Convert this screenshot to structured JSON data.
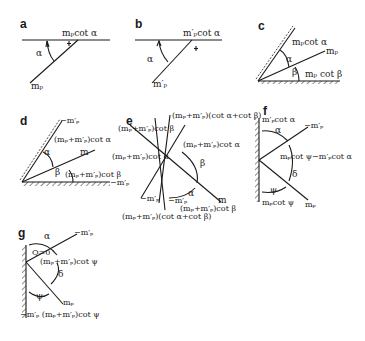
{
  "figure": {
    "panels": [
      {
        "id": "a",
        "label": "a",
        "texts": {
          "top": "mₚcot α",
          "alpha": "α",
          "m": "mₚ"
        }
      },
      {
        "id": "b",
        "label": "b",
        "texts": {
          "top": "m′ₚcot α",
          "alpha": "α",
          "m": "m′ₚ"
        }
      },
      {
        "id": "c",
        "label": "c",
        "texts": {
          "upper": "mₚcot α",
          "m": "mₚ",
          "alpha": "α",
          "beta": "β",
          "lower": "mₚ cot β"
        }
      },
      {
        "id": "d",
        "label": "d",
        "texts": {
          "top": "−m′ₚ",
          "upper": "(mₚ+m′ₚ)cot α",
          "m": "m",
          "alpha": "α",
          "beta": "β",
          "lower": "(mₚ+m′ₚ)cot β",
          "right": "−m′ₚ"
        }
      },
      {
        "id": "e",
        "label": "e",
        "texts": {
          "top": "(mₚ+m′ₚ)(cot α+cot β)",
          "leftTop": "(mₚ+m′ₚ)cot β",
          "rightMid": "(mₚ+m′ₚ)cot α",
          "leftMid": "(mₚ+m′ₚ)cot α",
          "beta": "β",
          "alpha": "α",
          "m": "m",
          "mp1": "−m′ₚ",
          "mp2": "−m′ₚ",
          "bottomRight": "(mₚ+m′ₚ)cot β",
          "bottom": "(mₚ+m′ₚ)(cot α+cot β)"
        }
      },
      {
        "id": "f",
        "label": "f",
        "texts": {
          "top": "m′ₚcot α",
          "alpha": "α",
          "mp": "−m′ₚ",
          "mid": "mₚcot ψ−m′ₚcot α",
          "delta": "δ",
          "psi": "ψ",
          "bottom": "mₚcot ψ",
          "m": "mₚ"
        }
      },
      {
        "id": "g",
        "label": "g",
        "texts": {
          "alpha": "α",
          "mp": "−m′ₚ",
          "q": "Q=0",
          "mid": "(mₚ+m′ₚ)cot ψ",
          "delta": "δ",
          "psi": "ψ",
          "m": "mₚ",
          "bottom": "−m′ₚ (mₚ+m′ₚ)cot ψ"
        }
      }
    ]
  }
}
